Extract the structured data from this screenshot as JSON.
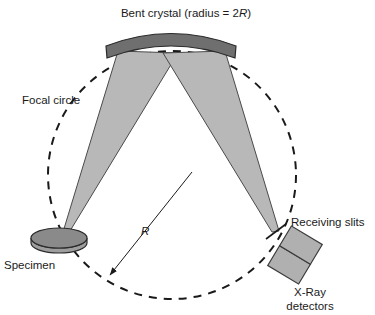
{
  "figure": {
    "type": "schematic-diagram",
    "background_color": "#ffffff"
  },
  "labels": {
    "title": "Bent crystal (radius = 2",
    "title_var": "R",
    "title_tail": ")",
    "focal_circle": "Focal circle",
    "specimen": "Specimen",
    "radius_symbol": "R",
    "receiving_slits": "Receiving slits",
    "detectors_line1": "X-Ray",
    "detectors_line2": "detectors"
  },
  "colors": {
    "crystal_fill": "#6f6f6f",
    "crystal_stroke": "#2b2b2b",
    "beam_fill": "#b8b8b8",
    "beam_stroke": "#4a4a4a",
    "specimen_top": "#8a8a8a",
    "specimen_side": "#9d9d9d",
    "detector_fill": "#b0b0b0",
    "detector_stroke": "#3a3a3a",
    "dash_stroke": "#1a1a1a",
    "text": "#1a1a1a"
  },
  "geometry": {
    "focal_circle": {
      "cx": 172,
      "cy": 175,
      "r": 124,
      "style": "dashed"
    },
    "crystal_arc": {
      "x_start": 106,
      "x_end": 236,
      "y_top": 30,
      "y_bottom": 52
    },
    "beam_cross_point": {
      "x": 167,
      "y": 112
    },
    "specimen_point": {
      "x": 63,
      "y": 232
    },
    "slit_point": {
      "x": 276,
      "y": 231
    },
    "radius_arrow": {
      "from_x": 190,
      "from_y": 173,
      "to_x": 108,
      "to_y": 277
    }
  }
}
